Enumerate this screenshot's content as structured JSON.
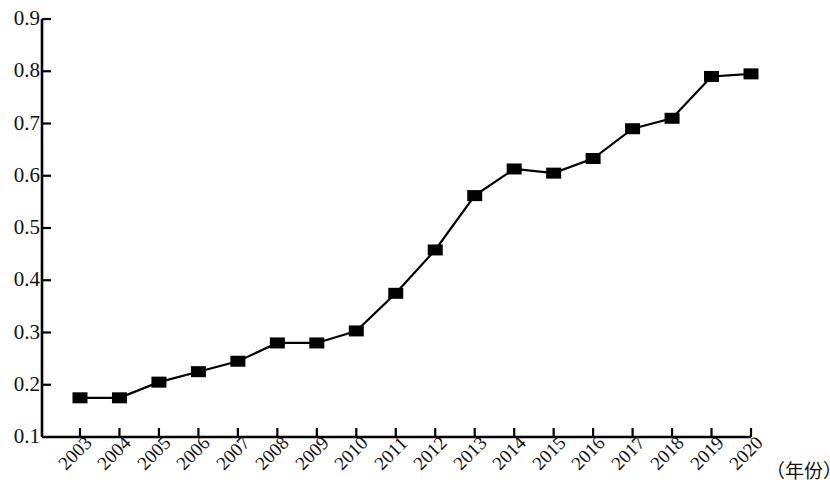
{
  "chart_data": {
    "type": "line",
    "title": "",
    "subtitle": "",
    "xlabel": "（年份）",
    "ylabel": "",
    "categories": [
      "2003",
      "2004",
      "2005",
      "2006",
      "2007",
      "2008",
      "2009",
      "2010",
      "2011",
      "2012",
      "2013",
      "2014",
      "2015",
      "2016",
      "2017",
      "2018",
      "2019",
      "2020"
    ],
    "values": [
      0.175,
      0.175,
      0.205,
      0.225,
      0.245,
      0.28,
      0.28,
      0.303,
      0.375,
      0.458,
      0.562,
      0.613,
      0.605,
      0.633,
      0.69,
      0.71,
      0.79,
      0.795
    ],
    "series": [
      {
        "name": "",
        "values": [
          0.175,
          0.175,
          0.205,
          0.225,
          0.245,
          0.28,
          0.28,
          0.303,
          0.375,
          0.458,
          0.562,
          0.613,
          0.605,
          0.633,
          0.69,
          0.71,
          0.79,
          0.795
        ]
      }
    ],
    "ylim": [
      0.1,
      0.9
    ],
    "y_ticks": [
      "0.9",
      "0.8",
      "0.7",
      "0.6",
      "0.5",
      "0.4",
      "0.3",
      "0.2",
      "0.1"
    ],
    "y_tick_values": [
      0.9,
      0.8,
      0.7,
      0.6,
      0.5,
      0.4,
      0.3,
      0.2,
      0.1
    ],
    "grid": false,
    "legend": null,
    "legend_position": "none",
    "marker": "square",
    "line_color": "#000000",
    "marker_color": "#000000",
    "axis_color": "#000000"
  }
}
